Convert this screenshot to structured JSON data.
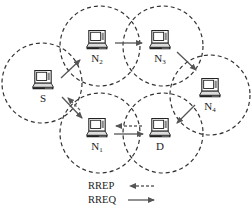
{
  "diagram": {
    "type": "network-topology",
    "nodes": [
      {
        "id": "S",
        "label": "S",
        "sub": "",
        "x": 43,
        "y": 80,
        "range_cx": 42,
        "range_cy": 83,
        "range_r": 40
      },
      {
        "id": "N2",
        "label": "N",
        "sub": "2",
        "x": 97,
        "y": 40,
        "range_cx": 100,
        "range_cy": 46,
        "range_r": 40
      },
      {
        "id": "N3",
        "label": "N",
        "sub": "3",
        "x": 160,
        "y": 40,
        "range_cx": 163,
        "range_cy": 46,
        "range_r": 40
      },
      {
        "id": "N4",
        "label": "N",
        "sub": "4",
        "x": 210,
        "y": 88,
        "range_cx": 210,
        "range_cy": 95,
        "range_r": 40
      },
      {
        "id": "N1",
        "label": "N",
        "sub": "1",
        "x": 97,
        "y": 128,
        "range_cx": 100,
        "range_cy": 133,
        "range_r": 40
      },
      {
        "id": "D",
        "label": "D",
        "sub": "",
        "x": 160,
        "y": 128,
        "range_cx": 163,
        "range_cy": 133,
        "range_r": 40
      }
    ],
    "edges": [
      {
        "from": "S",
        "to": "N2",
        "type": "RREQ"
      },
      {
        "from": "N2",
        "to": "N3",
        "type": "RREQ"
      },
      {
        "from": "N3",
        "to": "N4",
        "type": "RREQ"
      },
      {
        "from": "N4",
        "to": "D",
        "type": "RREQ"
      },
      {
        "from": "S",
        "to": "N1",
        "type": "RREQ"
      },
      {
        "from": "N1",
        "to": "D",
        "type": "RREQ"
      },
      {
        "from": "D",
        "to": "N1",
        "type": "RREP"
      },
      {
        "from": "N1",
        "to": "S",
        "type": "RREP"
      }
    ]
  },
  "legend": {
    "rrep_label": "RREP",
    "rreq_label": "RREQ"
  },
  "colors": {
    "stroke": "#333333",
    "arrow": "#555555",
    "background": "#ffffff"
  }
}
